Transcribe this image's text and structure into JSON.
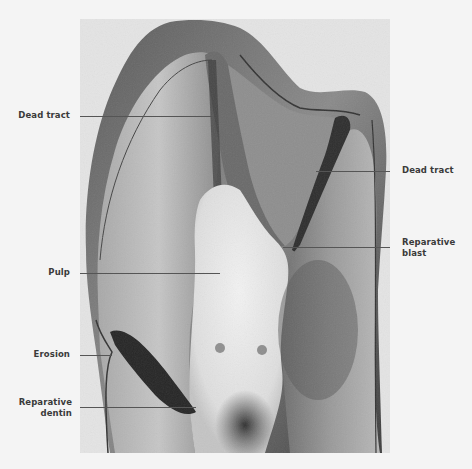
{
  "figure": {
    "colors": {
      "page_background": "#f4f4f4",
      "photo_background": "#e4e4e4",
      "leader_line": "#555555",
      "label_text": "#3a3a3a"
    }
  },
  "labels": {
    "dead_tract_left": "Dead tract",
    "dead_tract_right": "Dead tract",
    "reparative_blast_line1": "Reparative",
    "reparative_blast_line2": "blast",
    "pulp": "Pulp",
    "erosion": "Erosion",
    "reparative_dentin_line1": "Reparative",
    "reparative_dentin_line2": "dentin"
  }
}
